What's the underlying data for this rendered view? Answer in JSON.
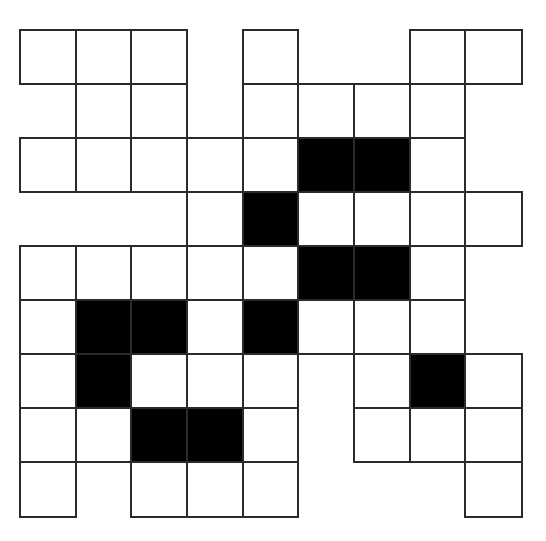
{
  "puzzle": {
    "type": "crossword-grid",
    "rows": 9,
    "cols": 9,
    "colors": {
      "white_cell": "#ffffff",
      "black_cell": "#000000",
      "border": "#2b2b2b"
    },
    "legend": {
      "W": "white (answer) cell",
      "B": "black (blocked) cell",
      ".": "no cell"
    },
    "layout": [
      "WWW.W..WW",
      ".WW.WWWW.",
      "WWWWWBBW.",
      "...WBWWWW",
      "WWWWWBBW.",
      "WBBWBWWW.",
      "WBWWW.WBW",
      "WWBBW.WWW",
      "W.WWW...W"
    ]
  }
}
